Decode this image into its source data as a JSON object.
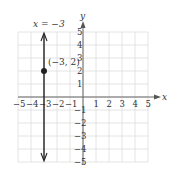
{
  "chart_data": {
    "type": "line",
    "title": "",
    "xlabel": "x",
    "ylabel": "y",
    "xlim": [
      -5,
      5
    ],
    "ylim": [
      -5,
      5
    ],
    "grid": true,
    "x_ticks": [
      "-5",
      "-4",
      "-3",
      "-2",
      "-1",
      "1",
      "2",
      "3",
      "4",
      "5"
    ],
    "y_ticks": [
      "5",
      "4",
      "3",
      "2",
      "1",
      "-1",
      "-2",
      "-3",
      "-4",
      "-5"
    ],
    "series": [
      {
        "name": "x = -3",
        "type": "vertical-line",
        "x": -3
      }
    ],
    "points": [
      {
        "x": -3,
        "y": 2,
        "label": "(-3, 2)"
      }
    ],
    "annotations": [
      {
        "text": "x = −3",
        "position": "top-left"
      },
      {
        "text": "(−3, 2)",
        "at": [
          -3,
          2
        ]
      }
    ]
  },
  "labels": {
    "equation": "x = −3",
    "point": "(−3, 2)",
    "x_axis": "x",
    "y_axis": "y"
  }
}
